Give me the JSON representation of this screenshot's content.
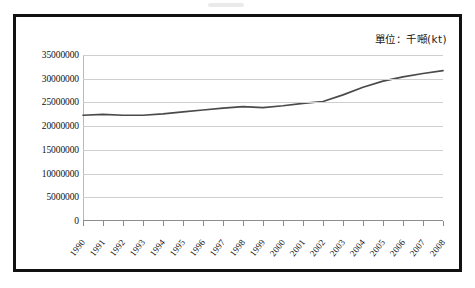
{
  "figure": {
    "unit_caption": "單位：千噸(kt)",
    "line_color": "#4a4a4a",
    "grid_color": "#cfcfcf",
    "frame_color": "#111111"
  },
  "chart_data": {
    "type": "line",
    "title": "",
    "subtitle": "",
    "xlabel": "",
    "ylabel": "",
    "unit": "單位：千噸(kt)",
    "grid": true,
    "legend": "none",
    "xlim": [
      1990,
      2008
    ],
    "ylim": [
      0,
      35000000
    ],
    "ytick_values": [
      0,
      5000000,
      10000000,
      15000000,
      20000000,
      25000000,
      30000000,
      35000000
    ],
    "ytick_labels": [
      "0",
      "5000000",
      "10000000",
      "15000000",
      "20000000",
      "25000000",
      "30000000",
      "35000000"
    ],
    "categories": [
      "1990",
      "1991",
      "1992",
      "1993",
      "1994",
      "1995",
      "1996",
      "1997",
      "1998",
      "1999",
      "2000",
      "2001",
      "2002",
      "2003",
      "2004",
      "2005",
      "2006",
      "2007",
      "2008"
    ],
    "series": [
      {
        "name": "總量",
        "values": [
          22300000,
          22500000,
          22300000,
          22300000,
          22600000,
          23000000,
          23400000,
          23800000,
          24100000,
          23900000,
          24300000,
          24800000,
          25200000,
          26600000,
          28200000,
          29500000,
          30400000,
          31100000,
          31700000
        ]
      }
    ]
  }
}
